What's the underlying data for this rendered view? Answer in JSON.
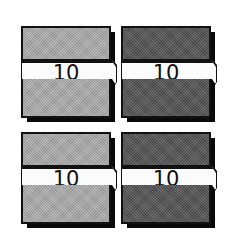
{
  "chips": [
    {
      "label": "10",
      "shade": "light",
      "color": "#a9a9a9"
    },
    {
      "label": "10",
      "shade": "dark",
      "color": "#585858"
    },
    {
      "label": "10",
      "shade": "light",
      "color": "#a9a9a9"
    },
    {
      "label": "10",
      "shade": "dark",
      "color": "#585858"
    }
  ]
}
